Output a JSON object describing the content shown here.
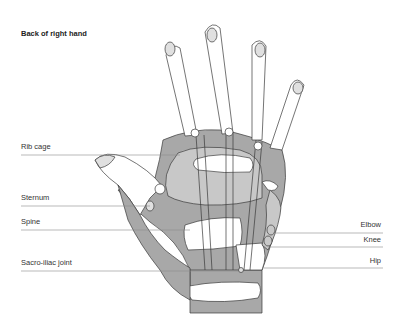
{
  "title": "Back of right hand",
  "labels_left": [
    {
      "text": "Rib cage",
      "y": 148
    },
    {
      "text": "Sternum",
      "y": 199
    },
    {
      "text": "Spine",
      "y": 223
    },
    {
      "text": "Sacro-iliac joint",
      "y": 264
    }
  ],
  "labels_right": [
    {
      "text": "Elbow",
      "y": 226
    },
    {
      "text": "Knee",
      "y": 240
    },
    {
      "text": "Hip",
      "y": 261
    }
  ],
  "colors": {
    "dark_zone": "#a8a8a8",
    "mid_zone": "#c8c8c8",
    "light_zone": "#e0e0e0",
    "outline": "#3a3a3a",
    "leader_line": "#8a8a8a"
  }
}
